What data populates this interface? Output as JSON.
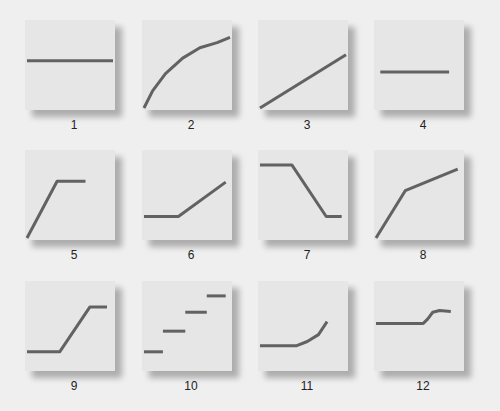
{
  "figure": {
    "line_color": "#626262",
    "panel_color": "#e6e6e6",
    "background_color": "#efefef"
  },
  "panels": [
    {
      "label": "1",
      "shape": "constant",
      "points": [
        [
          0,
          0.55
        ],
        [
          1,
          0.55
        ]
      ]
    },
    {
      "label": "2",
      "shape": "decelerating-curve",
      "points": [
        [
          0,
          0
        ],
        [
          0.1,
          0.2
        ],
        [
          0.25,
          0.4
        ],
        [
          0.45,
          0.58
        ],
        [
          0.65,
          0.7
        ],
        [
          0.85,
          0.76
        ],
        [
          1,
          0.82
        ]
      ]
    },
    {
      "label": "3",
      "shape": "linear-increase",
      "points": [
        [
          0,
          0
        ],
        [
          1,
          0.62
        ]
      ]
    },
    {
      "label": "4",
      "shape": "constant-low",
      "points": [
        [
          0.05,
          0.42
        ],
        [
          0.85,
          0.42
        ]
      ]
    },
    {
      "label": "5",
      "shape": "rise-then-plateau",
      "points": [
        [
          0,
          0
        ],
        [
          0.35,
          0.66
        ],
        [
          0.68,
          0.66
        ]
      ]
    },
    {
      "label": "6",
      "shape": "plateau-then-rise",
      "points": [
        [
          0,
          0.25
        ],
        [
          0.4,
          0.25
        ],
        [
          0.95,
          0.65
        ]
      ]
    },
    {
      "label": "7",
      "shape": "plateau-fall-plateau",
      "points": [
        [
          0,
          0.85
        ],
        [
          0.37,
          0.85
        ],
        [
          0.77,
          0.25
        ],
        [
          0.95,
          0.25
        ]
      ]
    },
    {
      "label": "8",
      "shape": "steep-then-gentle-rise",
      "points": [
        [
          0,
          0
        ],
        [
          0.34,
          0.55
        ],
        [
          0.95,
          0.8
        ]
      ]
    },
    {
      "label": "9",
      "shape": "plateau-rise-plateau",
      "points": [
        [
          0,
          0.2
        ],
        [
          0.38,
          0.2
        ],
        [
          0.73,
          0.72
        ],
        [
          0.93,
          0.72
        ]
      ]
    },
    {
      "label": "10",
      "shape": "step-function",
      "segments": [
        [
          [
            0,
            0.2
          ],
          [
            0.22,
            0.2
          ]
        ],
        [
          [
            0.22,
            0.44
          ],
          [
            0.48,
            0.44
          ]
        ],
        [
          [
            0.48,
            0.66
          ],
          [
            0.73,
            0.66
          ]
        ],
        [
          [
            0.73,
            0.85
          ],
          [
            0.95,
            0.85
          ]
        ]
      ]
    },
    {
      "label": "11",
      "shape": "accelerating-curve",
      "points": [
        [
          0,
          0.27
        ],
        [
          0.42,
          0.27
        ],
        [
          0.55,
          0.32
        ],
        [
          0.68,
          0.4
        ],
        [
          0.78,
          0.55
        ]
      ]
    },
    {
      "label": "12",
      "shape": "sigmoid-step",
      "points": [
        [
          0,
          0.53
        ],
        [
          0.55,
          0.53
        ],
        [
          0.6,
          0.58
        ],
        [
          0.66,
          0.66
        ],
        [
          0.74,
          0.68
        ],
        [
          0.87,
          0.67
        ]
      ]
    }
  ]
}
